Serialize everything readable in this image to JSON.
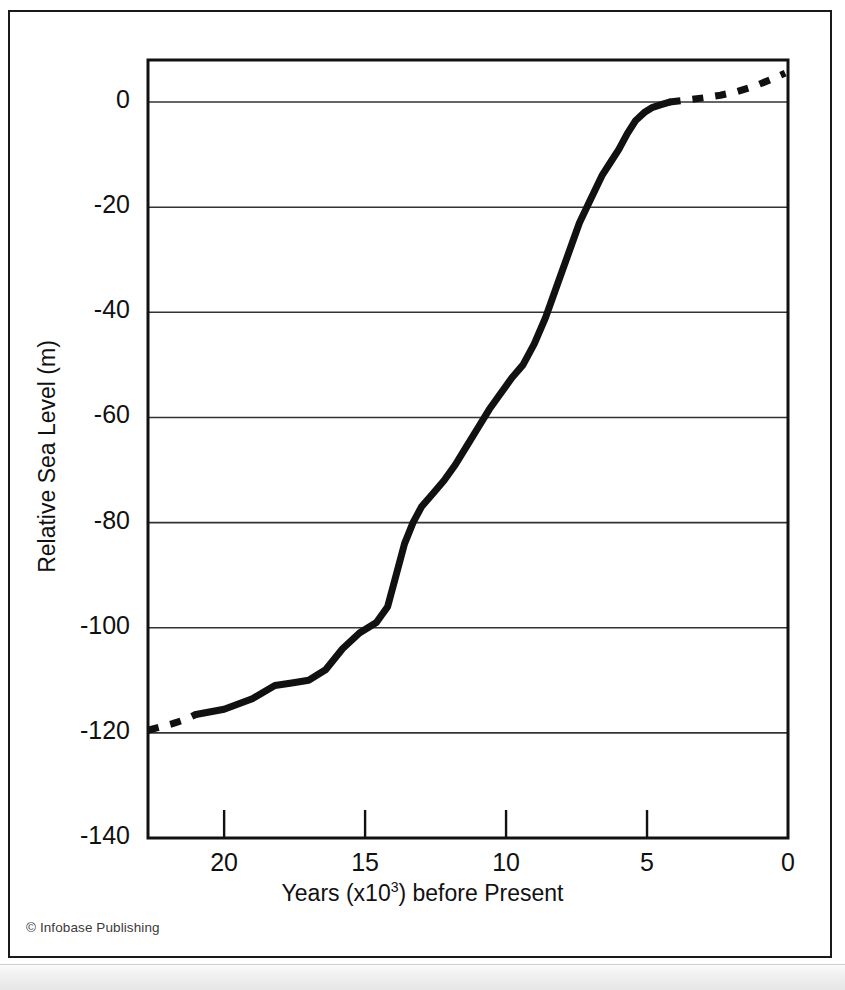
{
  "figure": {
    "credit": "© Infobase Publishing"
  },
  "chart_data": {
    "type": "line",
    "title": "",
    "xlabel_prefix": "Years (x10",
    "xlabel_exponent": "3",
    "xlabel_suffix": ") before Present",
    "xlabel": "Years (x10^3) before Present",
    "ylabel": "Relative Sea Level (m)",
    "xlim": [
      22.7,
      0
    ],
    "ylim": [
      -140,
      8
    ],
    "x_axis_reversed": true,
    "grid": "horizontal",
    "legend": "none",
    "xticks": [
      20,
      15,
      10,
      5,
      0
    ],
    "xtick_labels": [
      "20",
      "15",
      "10",
      "5",
      "0"
    ],
    "yticks": [
      0,
      -20,
      -40,
      -60,
      -80,
      -100,
      -120,
      -140
    ],
    "ytick_labels": [
      "0",
      "-20",
      "-40",
      "-60",
      "-80",
      "-100",
      "-120",
      "-140"
    ],
    "gridline_values": [
      0,
      -20,
      -40,
      -60,
      -80,
      -100,
      -120
    ],
    "series": [
      {
        "name": "Relative sea level (reconstructed)",
        "style": "solid",
        "color": "#111111",
        "width": 7,
        "x": [
          21.0,
          20.0,
          19.0,
          18.2,
          17.6,
          17.0,
          16.4,
          15.8,
          15.2,
          14.6,
          14.2,
          13.9,
          13.6,
          13.3,
          13.0,
          12.6,
          12.2,
          11.8,
          11.4,
          11.0,
          10.6,
          10.2,
          9.8,
          9.4,
          9.0,
          8.6,
          8.2,
          7.8,
          7.4,
          7.0,
          6.6,
          6.3,
          6.0,
          5.7,
          5.4,
          5.1,
          4.8,
          4.5,
          4.2
        ],
        "y": [
          -116.5,
          -115.5,
          -113.5,
          -111.0,
          -110.5,
          -110.0,
          -108.0,
          -104.0,
          -101.0,
          -99.0,
          -96.0,
          -90.0,
          -84.0,
          -80.0,
          -77.0,
          -74.5,
          -72.0,
          -69.0,
          -65.5,
          -62.0,
          -58.5,
          -55.5,
          -52.5,
          -50.0,
          -46.0,
          -41.0,
          -35.0,
          -29.0,
          -23.0,
          -18.5,
          -14.0,
          -11.5,
          -9.0,
          -6.0,
          -3.5,
          -2.0,
          -1.0,
          -0.5,
          0.0
        ]
      },
      {
        "name": "Relative sea level (inferred, older)",
        "style": "dashed",
        "color": "#111111",
        "width": 7,
        "x": [
          22.7,
          22.2,
          21.8,
          21.4,
          21.0
        ],
        "y": [
          -119.5,
          -118.8,
          -118.2,
          -117.5,
          -116.5
        ]
      },
      {
        "name": "Relative sea level (inferred, recent)",
        "style": "dashed",
        "color": "#111111",
        "width": 7,
        "x": [
          4.2,
          3.6,
          3.0,
          2.4,
          1.8,
          1.2,
          0.6,
          0.1
        ],
        "y": [
          0.0,
          0.4,
          0.8,
          1.3,
          2.0,
          3.0,
          4.3,
          5.5
        ]
      }
    ],
    "annotations": []
  }
}
